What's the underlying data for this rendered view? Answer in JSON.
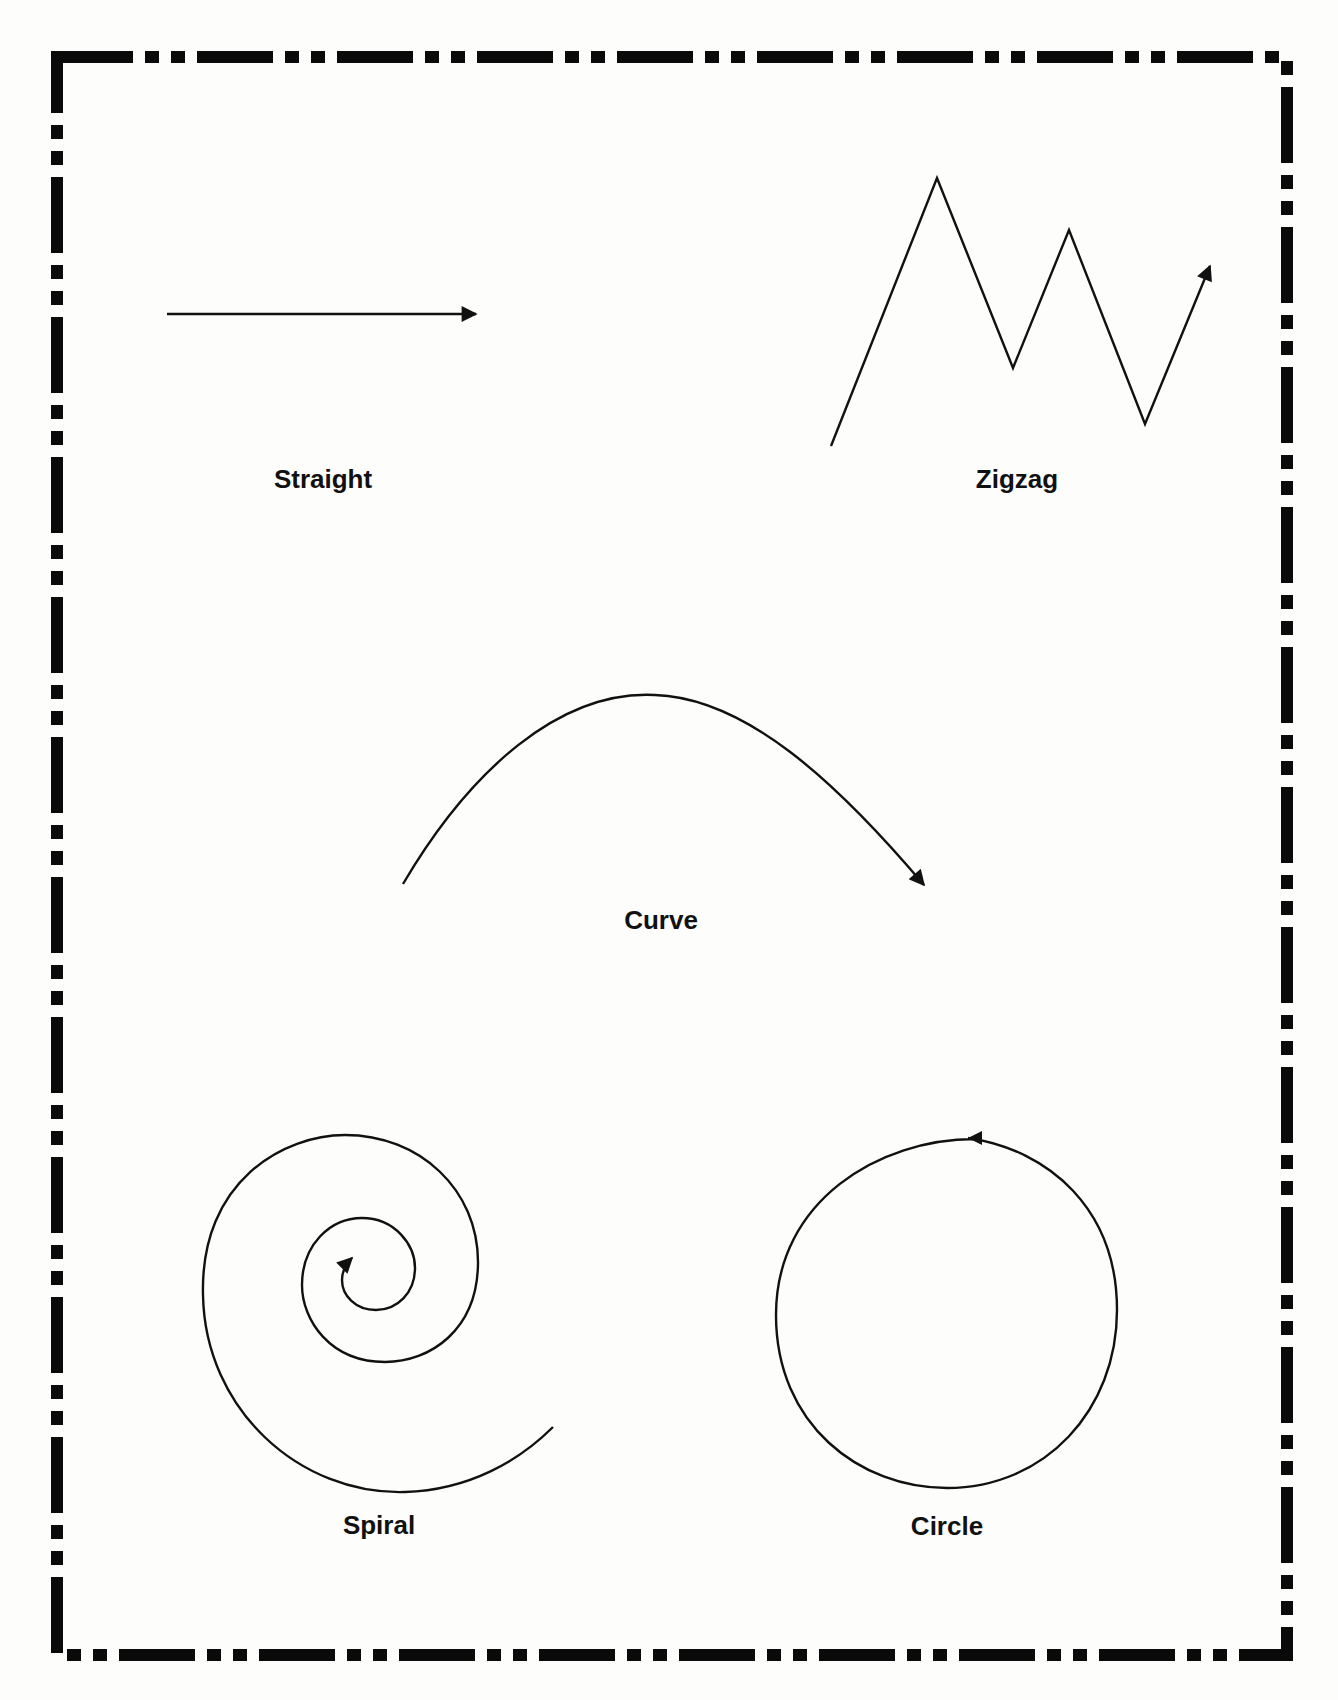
{
  "worksheet": {
    "background": "#fdfdfc",
    "ink_color": "#111111",
    "border": {
      "style": "dash-dot-dot",
      "rect": {
        "x": 55,
        "y": 55,
        "width": 1234,
        "height": 1602
      },
      "stroke_width": 12
    },
    "shapes": [
      {
        "id": "straight",
        "label": "Straight",
        "type": "straight-line-arrow",
        "label_pos": {
          "x": 323,
          "y": 466
        }
      },
      {
        "id": "zigzag",
        "label": "Zigzag",
        "type": "zigzag-line-arrow",
        "label_pos": {
          "x": 1017,
          "y": 466
        }
      },
      {
        "id": "curve",
        "label": "Curve",
        "type": "curved-line-arrow",
        "label_pos": {
          "x": 661,
          "y": 907
        }
      },
      {
        "id": "spiral",
        "label": "Spiral",
        "type": "spiral-line-arrow",
        "label_pos": {
          "x": 379,
          "y": 1512
        }
      },
      {
        "id": "circle",
        "label": "Circle",
        "type": "circle-line-arrow",
        "label_pos": {
          "x": 947,
          "y": 1513
        }
      }
    ]
  }
}
